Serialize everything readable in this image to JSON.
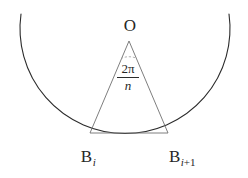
{
  "figure": {
    "kind": "geometry-diagram",
    "background_color": "#ffffff",
    "stroke_color": "#2b2b2b",
    "helper_stroke_color": "#8a8a8a",
    "labels": {
      "center": "O",
      "vertex_left": "B",
      "vertex_left_sub": "i",
      "vertex_right": "B",
      "vertex_right_sub_index": "i",
      "vertex_right_sub_op": "+",
      "vertex_right_sub_addend": "1",
      "angle_numerator": "2π",
      "angle_denominator": "n"
    },
    "geometry": {
      "circle_center_x": 125,
      "circle_center_y": 37,
      "circle_radius": 105,
      "arc_start_x": 21,
      "arc_start_y": 14,
      "arc_end_x": 229,
      "arc_end_y": 14,
      "apex_x": 129,
      "apex_y": 41,
      "vertex_left_x": 90,
      "vertex_left_y": 133,
      "vertex_right_x": 168,
      "vertex_right_y": 133,
      "angle_marker_radius": 19,
      "stroke_width": 1
    }
  }
}
